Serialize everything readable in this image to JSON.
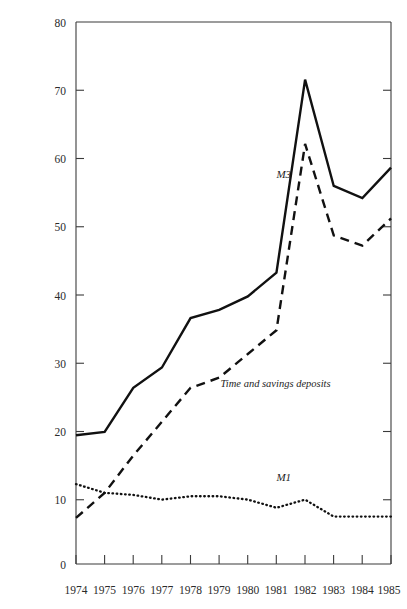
{
  "figure": {
    "top_caption": "",
    "background_color": "#ffffff",
    "ink_color": "#111111"
  },
  "chart_data": {
    "type": "line",
    "title": "",
    "xlabel": "",
    "ylabel": "",
    "x": [
      1974,
      1975,
      1976,
      1977,
      1978,
      1979,
      1980,
      1981,
      1982,
      1983,
      1984,
      1985
    ],
    "xtick_labels": [
      "1974",
      "1975",
      "1976",
      "1977",
      "1978",
      "1979",
      "1980",
      "1981",
      "1982",
      "1983",
      "1984",
      "1985"
    ],
    "ytick_labels": [
      "0",
      "10",
      "20",
      "30",
      "40",
      "50",
      "60",
      "70",
      "80"
    ],
    "yticks": [
      0,
      10,
      20,
      30,
      40,
      50,
      60,
      70,
      80
    ],
    "xlim": [
      1974,
      1985
    ],
    "ylim": [
      0,
      80
    ],
    "grid": false,
    "legend_position": "inline-annotations",
    "series": [
      {
        "name": "M3",
        "style": "solid",
        "label_text": "M3",
        "label_x": 1981.0,
        "label_y": 57.0,
        "values": [
          19.0,
          19.5,
          26.0,
          29.0,
          36.3,
          37.5,
          39.5,
          43.0,
          71.5,
          55.8,
          54.0,
          58.5
        ]
      },
      {
        "name": "Time and savings deposits",
        "style": "dashed",
        "label_text": "Time and savings deposits",
        "label_x": 1979.05,
        "label_y": 26.2,
        "values": [
          6.8,
          10.5,
          16.0,
          21.0,
          26.0,
          27.5,
          31.0,
          34.5,
          62.0,
          48.5,
          47.0,
          51.0
        ]
      },
      {
        "name": "M1",
        "style": "dotted",
        "label_text": "M1",
        "label_x": 1981.0,
        "label_y": 12.3,
        "values": [
          11.8,
          10.5,
          10.2,
          9.5,
          10.0,
          10.0,
          9.5,
          8.3,
          9.5,
          7.0,
          7.0,
          7.0
        ]
      }
    ]
  }
}
